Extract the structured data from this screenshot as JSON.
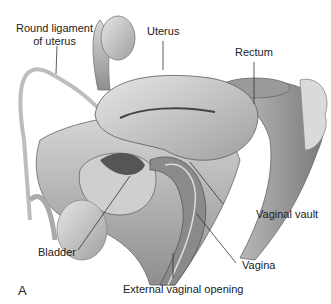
{
  "figure": {
    "panel_letter": "A",
    "labels": {
      "round_ligament": "Round ligament\nof uterus",
      "round_ligament_line1": "Round ligament",
      "round_ligament_line2": "of uterus",
      "uterus": "Uterus",
      "rectum": "Rectum",
      "vaginal_vault": "Vaginal vault",
      "bladder": "Bladder",
      "vagina": "Vagina",
      "external_vaginal_opening": "External vaginal opening"
    }
  }
}
